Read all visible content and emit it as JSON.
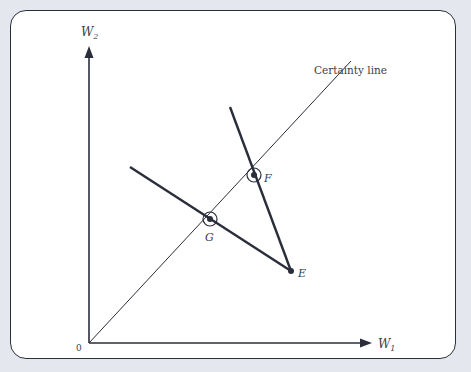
{
  "diagram": {
    "axes": {
      "x_label": "W",
      "x_sub": "1",
      "y_label": "W",
      "y_sub": "2",
      "origin_label": "0"
    },
    "certainty_line_label": "Certainty line",
    "points": [
      {
        "id": "E",
        "label": "E"
      },
      {
        "id": "F",
        "label": "F"
      },
      {
        "id": "G",
        "label": "G"
      }
    ],
    "colors": {
      "line": "#2a2d3a",
      "frame_bg": "#ffffff",
      "page_bg": "#e4e8ee"
    }
  }
}
